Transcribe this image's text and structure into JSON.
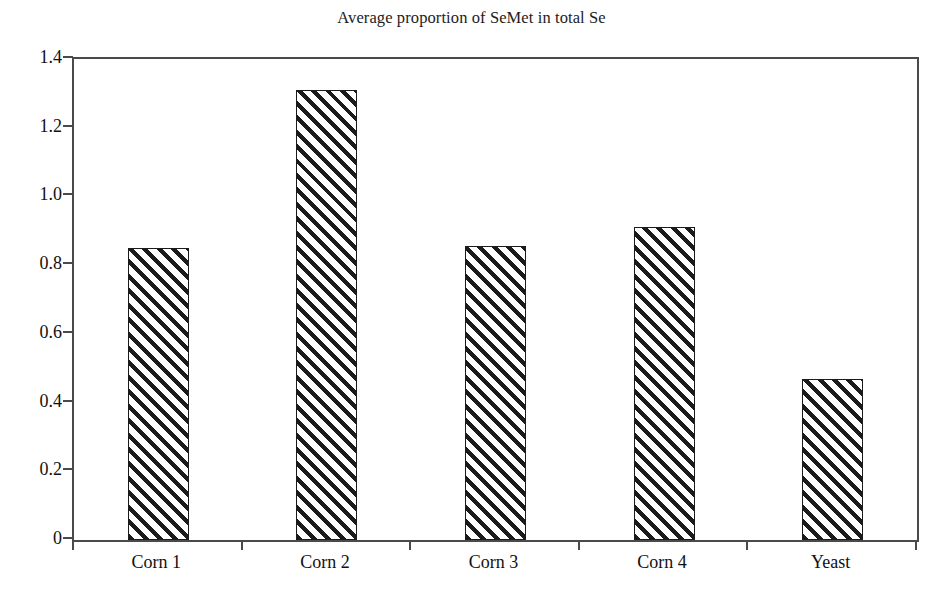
{
  "chart_data": {
    "type": "bar",
    "title": "Average proportion of SeMet in total Se",
    "xlabel": "",
    "ylabel": "",
    "categories": [
      "Corn 1",
      "Corn 2",
      "Corn 3",
      "Corn 4",
      "Yeast"
    ],
    "values": [
      0.85,
      1.31,
      0.855,
      0.91,
      0.47
    ],
    "ylim": [
      0,
      1.4
    ],
    "y_ticks": [
      0,
      0.2,
      0.4,
      0.6,
      0.8,
      1.0,
      1.2,
      1.4
    ],
    "y_tick_labels": [
      "0",
      "0.2",
      "0.4",
      "0.6",
      "0.8",
      "1.0",
      "1.2",
      "1.4"
    ],
    "grid": false,
    "legend": false,
    "legend_position": "none",
    "bar_fill": "diagonal-hatch",
    "bar_fill_color": "#ffffff",
    "bar_edge_color": "#1b1b1b",
    "plot_background": "#ffffff",
    "axis_color": "#4a4a4a"
  }
}
